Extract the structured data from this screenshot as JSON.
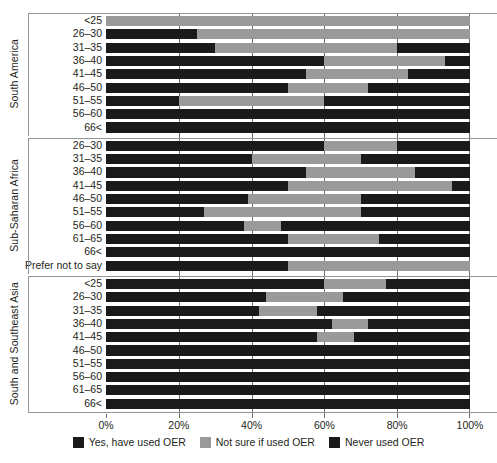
{
  "chart_data": {
    "type": "bar",
    "subtype": "stacked-horizontal-100",
    "title": "",
    "xlabel": "",
    "ylabel": "",
    "xlim": [
      0,
      100
    ],
    "xticks": [
      "0%",
      "20%",
      "40%",
      "60%",
      "80%",
      "100%"
    ],
    "xtick_values": [
      0,
      20,
      40,
      60,
      80,
      100
    ],
    "grid": true,
    "legend_position": "bottom",
    "series": [
      {
        "name": "Yes, have used OER",
        "color": "#1a1a1a"
      },
      {
        "name": "Not sure if used OER",
        "color": "#9a9a9a"
      },
      {
        "name": "Never used OER",
        "color": "#1a1a1a"
      }
    ],
    "groups": [
      {
        "name": "South America",
        "rows": [
          {
            "category": "<25",
            "values": [
              0,
              100,
              0
            ]
          },
          {
            "category": "26–30",
            "values": [
              25,
              75,
              0
            ]
          },
          {
            "category": "31–35",
            "values": [
              30,
              50,
              20
            ]
          },
          {
            "category": "36–40",
            "values": [
              60,
              33,
              7
            ]
          },
          {
            "category": "41–45",
            "values": [
              55,
              28,
              17
            ]
          },
          {
            "category": "46–50",
            "values": [
              50,
              22,
              28
            ]
          },
          {
            "category": "51–55",
            "values": [
              20,
              40,
              40
            ]
          },
          {
            "category": "56–60",
            "values": [
              0,
              0,
              100
            ]
          },
          {
            "category": "66<",
            "values": [
              0,
              0,
              100
            ]
          }
        ]
      },
      {
        "name": "Sub-Saharan Africa",
        "rows": [
          {
            "category": "26–30",
            "values": [
              60,
              20,
              20
            ]
          },
          {
            "category": "31–35",
            "values": [
              40,
              30,
              30
            ]
          },
          {
            "category": "36–40",
            "values": [
              55,
              30,
              15
            ]
          },
          {
            "category": "41–45",
            "values": [
              50,
              45,
              5
            ]
          },
          {
            "category": "46–50",
            "values": [
              39,
              31,
              30
            ]
          },
          {
            "category": "51–55",
            "values": [
              27,
              43,
              30
            ]
          },
          {
            "category": "56–60",
            "values": [
              38,
              10,
              52
            ]
          },
          {
            "category": "61–65",
            "values": [
              50,
              25,
              25
            ]
          },
          {
            "category": "66<",
            "values": [
              50,
              0,
              50
            ]
          },
          {
            "category": "Prefer not to say",
            "values": [
              50,
              50,
              0
            ]
          }
        ]
      },
      {
        "name": "South and Southeast Asia",
        "rows": [
          {
            "category": "<25",
            "values": [
              60,
              17,
              23
            ]
          },
          {
            "category": "26–30",
            "values": [
              44,
              21,
              35
            ]
          },
          {
            "category": "31–35",
            "values": [
              42,
              16,
              42
            ]
          },
          {
            "category": "36–40",
            "values": [
              62,
              10,
              28
            ]
          },
          {
            "category": "41–45",
            "values": [
              58,
              10,
              32
            ]
          },
          {
            "category": "46–50",
            "values": [
              93,
              0,
              7
            ]
          },
          {
            "category": "51–55",
            "values": [
              73,
              0,
              27
            ]
          },
          {
            "category": "56–60",
            "values": [
              100,
              0,
              0
            ]
          },
          {
            "category": "61–65",
            "values": [
              100,
              0,
              0
            ]
          },
          {
            "category": "66<",
            "values": [
              100,
              0,
              0
            ]
          }
        ]
      }
    ]
  },
  "legend": {
    "items": [
      {
        "label": "Yes, have used OER",
        "color": "#1a1a1a"
      },
      {
        "label": "Not sure if used OER",
        "color": "#9a9a9a"
      },
      {
        "label": "Never used OER",
        "color": "#1a1a1a"
      }
    ]
  },
  "colors": {
    "yes": "#1a1a1a",
    "not_sure": "#9a9a9a",
    "never": "#1a1a1a",
    "gridline": "#6d6e70",
    "separator": "#939598",
    "text": "#231f20"
  }
}
